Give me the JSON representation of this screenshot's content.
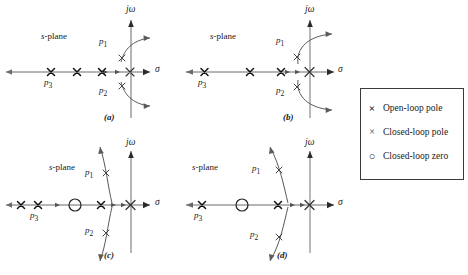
{
  "figure": {
    "axis_labels": {
      "imaginary": "jω",
      "real": "σ",
      "plane": "s-plane"
    },
    "pole_labels": {
      "p1": "p1",
      "p2": "p2",
      "p3": "p3"
    }
  },
  "panels": [
    {
      "id": "a",
      "caption": "(a)",
      "plane_label": "s-plane",
      "imag_axis_label": "jω",
      "real_axis_label": "σ",
      "p1_label": "p1",
      "p2_label": "p2",
      "p3_label": "p3"
    },
    {
      "id": "b",
      "caption": "(b)",
      "plane_label": "s-plane",
      "imag_axis_label": "jω",
      "real_axis_label": "σ",
      "p1_label": "p1",
      "p2_label": "p2",
      "p3_label": "p3"
    },
    {
      "id": "c",
      "caption": "(c)",
      "plane_label": "s-plane",
      "imag_axis_label": "jω",
      "real_axis_label": "σ",
      "p1_label": "p1",
      "p2_label": "p2",
      "p3_label": "p3"
    },
    {
      "id": "d",
      "caption": "(d)",
      "plane_label": "s-plane",
      "imag_axis_label": "jω",
      "real_axis_label": "σ",
      "p1_label": "p1",
      "p2_label": "p2",
      "p3_label": "p3"
    }
  ],
  "legend": {
    "items": [
      {
        "marker": "×",
        "label": "Open-loop pole"
      },
      {
        "marker": "×",
        "label": "Closed-loop pole"
      },
      {
        "marker": "○",
        "label": "Closed-loop zero"
      }
    ]
  }
}
